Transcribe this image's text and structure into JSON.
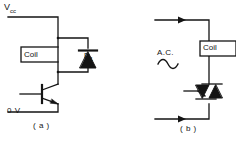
{
  "figure": {
    "type": "electronic-schematic",
    "stroke_color": "#141414",
    "background_color": "#ffffff"
  },
  "circuit_a": {
    "caption": "( a )",
    "supply_label": "V",
    "supply_sub": "cc",
    "ground_label": "0 V",
    "coil_label": "Coil",
    "diode_label": "D",
    "diode_sub": "1",
    "components": [
      {
        "name": "relay-coil",
        "label": "Coil"
      },
      {
        "name": "flyback-diode",
        "label": "D1"
      },
      {
        "name": "npn-transistor",
        "label": ""
      }
    ]
  },
  "circuit_b": {
    "caption": "( b )",
    "source_label": "A.C.",
    "source_symbol": "sine-wave",
    "coil_label": "Coil",
    "components": [
      {
        "name": "relay-coil",
        "label": "Coil"
      },
      {
        "name": "triac",
        "label": ""
      }
    ],
    "current_arrows": [
      {
        "name": "top-current-arrow",
        "direction": "right"
      },
      {
        "name": "bottom-current-arrow",
        "direction": "right"
      }
    ]
  }
}
